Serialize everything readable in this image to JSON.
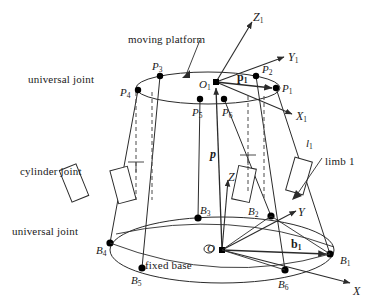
{
  "figure": {
    "kind": "stewart-platform-kinematic-diagram",
    "title": "",
    "stroke_color": "#2b2b2b",
    "text_color": "#1a1a1a",
    "background": "#ffffff",
    "dashed_color": "#4a4a4a",
    "node_fill": "#000000"
  },
  "annotations": [
    {
      "id": "moving-platform",
      "text": "moving platform",
      "x": 128,
      "y": 34
    },
    {
      "id": "universal-joint-top",
      "text": "universal joint",
      "x": 28,
      "y": 74
    },
    {
      "id": "cylinder-joint",
      "text": "cylinder joint",
      "x": 20,
      "y": 166
    },
    {
      "id": "universal-joint-bottom",
      "text": "universal joint",
      "x": 12,
      "y": 226
    },
    {
      "id": "fixed-base",
      "text": "fixed base",
      "x": 145,
      "y": 260
    },
    {
      "id": "limb-1",
      "text": "limb 1",
      "x": 325,
      "y": 156
    }
  ],
  "axes": [
    {
      "id": "Z1",
      "label": "Z",
      "sub": "1",
      "x": 253,
      "y": 11
    },
    {
      "id": "Y1",
      "label": "Y",
      "sub": "1",
      "x": 288,
      "y": 51
    },
    {
      "id": "X1",
      "label": "X",
      "sub": "1",
      "x": 296,
      "y": 110
    },
    {
      "id": "Z",
      "label": "Z",
      "sub": "",
      "x": 228,
      "y": 171
    },
    {
      "id": "Y",
      "label": "Y",
      "sub": "",
      "x": 298,
      "y": 206
    },
    {
      "id": "X",
      "label": "X",
      "sub": "",
      "x": 353,
      "y": 285
    }
  ],
  "platform_points": [
    {
      "id": "P1",
      "label": "P",
      "sub": "1",
      "px": 276,
      "py": 88,
      "lx": 282,
      "ly": 83
    },
    {
      "id": "P2",
      "label": "P",
      "sub": "2",
      "px": 256,
      "py": 76,
      "lx": 262,
      "ly": 64
    },
    {
      "id": "P3",
      "label": "P",
      "sub": "3",
      "px": 160,
      "py": 76,
      "lx": 152,
      "ly": 61
    },
    {
      "id": "P4",
      "label": "P",
      "sub": "4",
      "px": 138,
      "py": 90,
      "lx": 120,
      "ly": 87
    },
    {
      "id": "P5",
      "label": "P",
      "sub": "5",
      "px": 200,
      "py": 99,
      "lx": 192,
      "ly": 107
    },
    {
      "id": "P6",
      "label": "P",
      "sub": "6",
      "px": 224,
      "py": 99,
      "lx": 222,
      "ly": 107
    }
  ],
  "base_points": [
    {
      "id": "B1",
      "label": "B",
      "sub": "1",
      "px": 330,
      "py": 254,
      "lx": 340,
      "ly": 255
    },
    {
      "id": "B2",
      "label": "B",
      "sub": "2",
      "px": 271,
      "py": 216,
      "lx": 248,
      "ly": 206
    },
    {
      "id": "B3",
      "label": "B",
      "sub": "3",
      "px": 198,
      "py": 218,
      "lx": 200,
      "ly": 205
    },
    {
      "id": "B4",
      "label": "B",
      "sub": "4",
      "px": 110,
      "py": 243,
      "lx": 96,
      "ly": 245
    },
    {
      "id": "B5",
      "label": "B",
      "sub": "5",
      "px": 142,
      "py": 268,
      "lx": 131,
      "ly": 275
    },
    {
      "id": "B6",
      "label": "B",
      "sub": "6",
      "px": 285,
      "py": 270,
      "lx": 278,
      "ly": 279
    }
  ],
  "origins": [
    {
      "id": "O1",
      "label": "O",
      "sub": "1",
      "px": 216,
      "py": 82,
      "lx": 199,
      "ly": 79
    },
    {
      "id": "O",
      "label": "O",
      "sub": "",
      "px": 222,
      "py": 250,
      "lx": 207,
      "ly": 243
    }
  ],
  "vectors": [
    {
      "id": "p1",
      "label": "p",
      "sub": "1",
      "style": "bold",
      "x": 237,
      "y": 71,
      "from": [
        216,
        82
      ],
      "to": [
        276,
        88
      ]
    },
    {
      "id": "p",
      "label": "p",
      "sub": "",
      "style": "bold-italic",
      "x": 210,
      "y": 148,
      "from": [
        222,
        250
      ],
      "to": [
        216,
        82
      ]
    },
    {
      "id": "b1",
      "label": "b",
      "sub": "1",
      "style": "bold",
      "x": 291,
      "y": 238,
      "from": [
        222,
        250
      ],
      "to": [
        330,
        254
      ]
    }
  ],
  "limb_labels": [
    {
      "id": "l1",
      "label": "l",
      "sub": "1",
      "x": 306,
      "y": 138
    }
  ],
  "cylinders": [
    {
      "id": "cylinder-limb-4",
      "cx": 74,
      "cy": 183,
      "angle": -22
    },
    {
      "id": "cylinder-limb-3",
      "cx": 123,
      "cy": 185,
      "angle": -15
    },
    {
      "id": "cylinder-limb-2",
      "cx": 244,
      "cy": 184,
      "angle": 12
    },
    {
      "id": "cylinder-limb-1",
      "cx": 299,
      "cy": 176,
      "angle": 16
    }
  ],
  "legend_note": ""
}
